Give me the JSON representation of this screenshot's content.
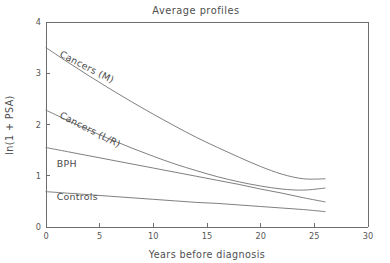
{
  "chart_data": {
    "type": "line",
    "title": "Average profiles",
    "xlabel": "Years before diagnosis",
    "ylabel": "ln(1 + PSA)",
    "xlim": [
      0,
      30
    ],
    "ylim": [
      0,
      4
    ],
    "xticks": [
      0,
      5,
      10,
      15,
      20,
      25,
      30
    ],
    "yticks": [
      0,
      1,
      2,
      3,
      4
    ],
    "xtick_labels": [
      "0",
      "5",
      "10",
      "15",
      "20",
      "25",
      "30"
    ],
    "ytick_labels": [
      "0",
      "1",
      "2",
      "3",
      "4"
    ],
    "grid": false,
    "legend_position": "inline-curve-labels",
    "x": [
      0,
      2,
      4,
      6,
      8,
      10,
      12,
      14,
      16,
      18,
      20,
      22,
      24,
      26
    ],
    "series": [
      {
        "name": "Cancers (M)",
        "label": "Cancers (M)",
        "label_rotation_deg": 27,
        "label_x": 1.2,
        "label_y": 3.33,
        "values": [
          3.5,
          3.22,
          2.95,
          2.69,
          2.44,
          2.2,
          1.97,
          1.75,
          1.55,
          1.36,
          1.18,
          1.03,
          0.94,
          0.94
        ]
      },
      {
        "name": "Cancers (L/R)",
        "label": "Cancers (L/R)",
        "label_rotation_deg": 27,
        "label_x": 1.2,
        "label_y": 2.14,
        "values": [
          2.28,
          2.08,
          1.89,
          1.71,
          1.54,
          1.38,
          1.23,
          1.1,
          0.98,
          0.88,
          0.8,
          0.74,
          0.72,
          0.76
        ]
      },
      {
        "name": "BPH",
        "label": "BPH",
        "label_rotation_deg": 0,
        "label_x": 1.0,
        "label_y": 1.18,
        "values": [
          1.55,
          1.47,
          1.39,
          1.31,
          1.23,
          1.15,
          1.07,
          0.99,
          0.91,
          0.83,
          0.74,
          0.66,
          0.57,
          0.49
        ]
      },
      {
        "name": "Controls",
        "label": "Controls",
        "label_rotation_deg": 0,
        "label_x": 1.0,
        "label_y": 0.52,
        "values": [
          0.69,
          0.66,
          0.63,
          0.6,
          0.57,
          0.54,
          0.51,
          0.48,
          0.46,
          0.43,
          0.4,
          0.37,
          0.34,
          0.3
        ]
      }
    ],
    "colors": {
      "line": "#707070",
      "axis": "#6e6e6e",
      "text": "#4f4f4f",
      "background": "#ffffff"
    }
  }
}
